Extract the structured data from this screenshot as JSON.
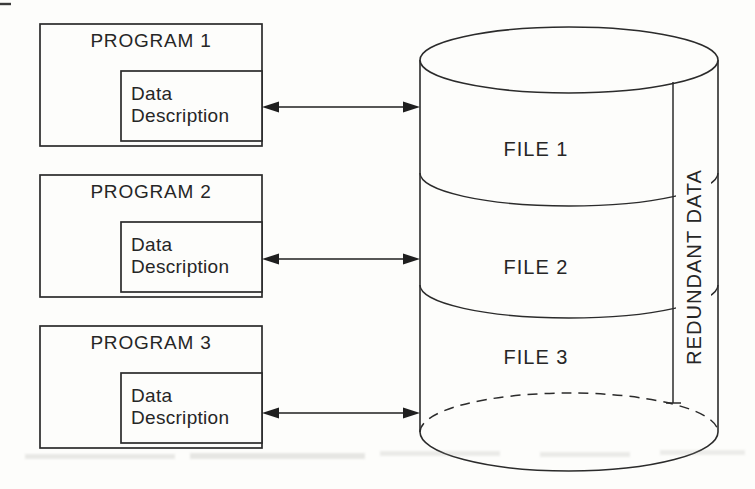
{
  "diagram": {
    "title_implicit": "",
    "programs": [
      {
        "label": "PROGRAM 1",
        "data_line1": "Data",
        "data_line2": "Description"
      },
      {
        "label": "PROGRAM 2",
        "data_line1": "Data",
        "data_line2": "Description"
      },
      {
        "label": "PROGRAM 3",
        "data_line1": "Data",
        "data_line2": "Description"
      }
    ],
    "storage": {
      "files": [
        {
          "label": "FILE 1"
        },
        {
          "label": "FILE 2"
        },
        {
          "label": "FILE 3"
        }
      ],
      "side_label": "REDUNDANT DATA"
    },
    "colors": {
      "line": "#2b2b2b",
      "background": "#fdfdfb",
      "text": "#262626"
    }
  }
}
